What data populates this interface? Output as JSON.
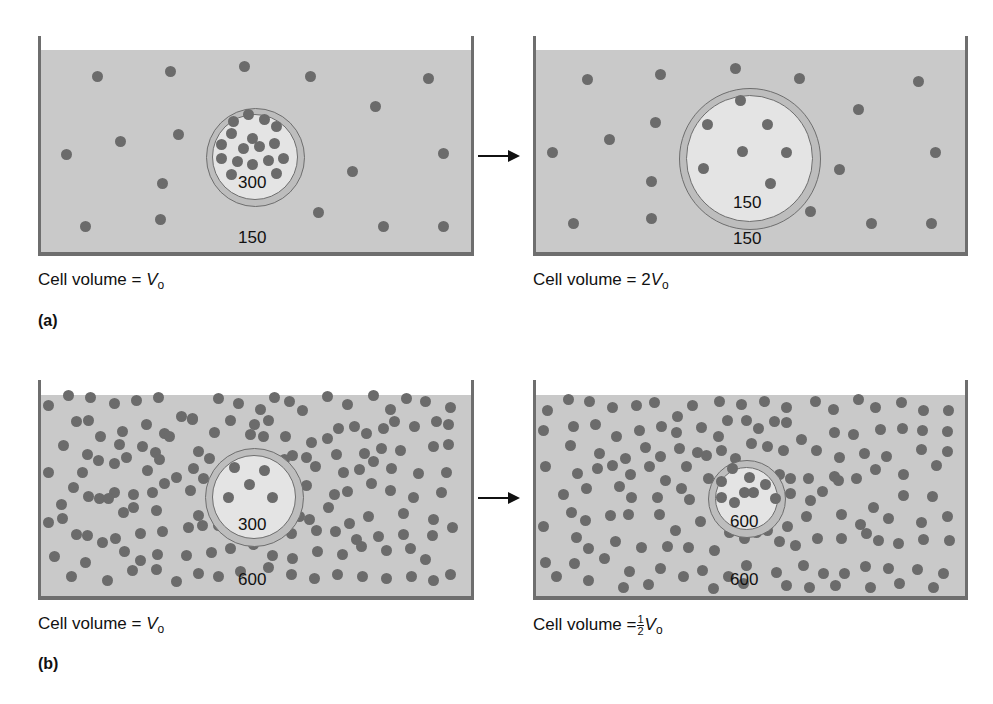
{
  "figure": {
    "part_a": {
      "label": "(a)",
      "arrow": "right-arrow",
      "left": {
        "inside_concentration": "300",
        "outside_concentration": "150",
        "caption_prefix": "Cell volume = ",
        "caption_var": "V",
        "caption_sub": "o",
        "caption_coef": ""
      },
      "right": {
        "inside_concentration": "150",
        "outside_concentration": "150",
        "caption_prefix": "Cell volume = ",
        "caption_coef": "2",
        "caption_var": "V",
        "caption_sub": "o"
      }
    },
    "part_b": {
      "label": "(b)",
      "arrow": "right-arrow",
      "left": {
        "inside_concentration": "300",
        "outside_concentration": "600",
        "caption_prefix": "Cell volume = ",
        "caption_var": "V",
        "caption_sub": "o",
        "caption_coef": ""
      },
      "right": {
        "inside_concentration": "600",
        "outside_concentration": "600",
        "caption_prefix": "Cell volume =",
        "caption_frac_num": "1",
        "caption_frac_den": "2",
        "caption_var": "V",
        "caption_sub": "o"
      }
    }
  },
  "colors": {
    "fluid": "#c9c9c9",
    "wall": "#6e6e6e",
    "solute": "#6b6b6b",
    "cell_interior": "#e4e4e4"
  }
}
